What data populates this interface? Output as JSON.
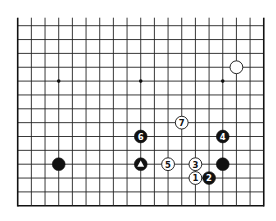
{
  "diagram": {
    "type": "go-board-diagram",
    "board_size": 19,
    "visible_rows": 14,
    "visible_cols": 19,
    "open_edge": "top",
    "colors": {
      "background": "#ffffff",
      "line": "#222222",
      "black_stone": "#111111",
      "white_stone": "#ffffff"
    },
    "star_points": [
      {
        "col": 3,
        "row": 4
      },
      {
        "col": 9,
        "row": 4
      },
      {
        "col": 15,
        "row": 4
      }
    ],
    "stones": [
      {
        "color": "white",
        "col": 16,
        "row": 3,
        "label": ""
      },
      {
        "color": "black",
        "col": 3,
        "row": 10,
        "label": ""
      },
      {
        "color": "black",
        "col": 9,
        "row": 10,
        "label": "",
        "marker": "triangle"
      },
      {
        "color": "black",
        "col": 15,
        "row": 10,
        "label": ""
      },
      {
        "color": "white",
        "col": 13,
        "row": 11,
        "label": "1"
      },
      {
        "color": "black",
        "col": 14,
        "row": 11,
        "label": "2"
      },
      {
        "color": "white",
        "col": 13,
        "row": 10,
        "label": "3"
      },
      {
        "color": "black",
        "col": 15,
        "row": 8,
        "label": "4"
      },
      {
        "color": "white",
        "col": 11,
        "row": 10,
        "label": "5"
      },
      {
        "color": "black",
        "col": 9,
        "row": 8,
        "label": "6"
      },
      {
        "color": "white",
        "col": 12,
        "row": 7,
        "label": "7"
      }
    ]
  }
}
